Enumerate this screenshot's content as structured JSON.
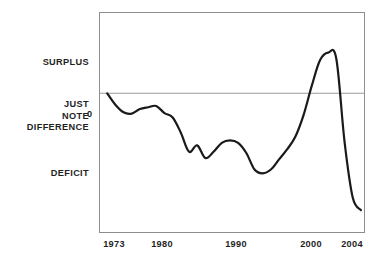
{
  "chart_data": {
    "type": "line",
    "title": "",
    "subtitle": "",
    "xlabel": "",
    "ylabel": "",
    "xlim": [
      1972,
      2004.5
    ],
    "ylim": [
      -5.5,
      3.2
    ],
    "grid": false,
    "legend_position": "none",
    "zero_line": 0,
    "x_tick_labels": [
      "1973",
      "1980",
      "1990",
      "2000",
      "2004"
    ],
    "x_tick_values": [
      1973,
      1980,
      1990,
      2000,
      2004
    ],
    "y_tick_labels": [
      "0"
    ],
    "y_tick_values": [
      0
    ],
    "y_category_labels": [
      {
        "label": "SURPLUS",
        "value": 1.9
      },
      {
        "label": "JUST NOTE DIFFERENCE",
        "value": 0.0
      },
      {
        "label": "DEFICIT",
        "value": -2.6
      }
    ],
    "series": [
      {
        "name": "Federal budget surplus/deficit (% of GDP)",
        "color": "#1a1a1a",
        "x": [
          1973,
          1974,
          1975,
          1976,
          1977,
          1978,
          1979,
          1980,
          1981,
          1982,
          1983,
          1984,
          1985,
          1986,
          1987,
          1988,
          1989,
          1990,
          1991,
          1992,
          1993,
          1994,
          1995,
          1996,
          1997,
          1998,
          1999,
          2000,
          2001,
          2002,
          2003,
          2004
        ],
        "values": [
          0.0,
          -0.45,
          -0.75,
          -0.8,
          -0.62,
          -0.55,
          -0.5,
          -0.78,
          -0.95,
          -1.55,
          -2.3,
          -2.05,
          -2.55,
          -2.3,
          -1.95,
          -1.85,
          -1.95,
          -2.35,
          -3.0,
          -3.15,
          -3.0,
          -2.6,
          -2.2,
          -1.7,
          -0.85,
          0.3,
          1.3,
          1.6,
          1.35,
          -1.9,
          -4.1,
          -4.6
        ]
      }
    ],
    "annotations": []
  },
  "labels": {
    "surplus": "SURPLUS",
    "just": "JUST",
    "note": "NOTE",
    "difference": "DIFFERENCE",
    "deficit": "DEFICIT",
    "zero": "0"
  },
  "xticks": {
    "t0": "1973",
    "t1": "1980",
    "t2": "1990",
    "t3": "2000",
    "t4": "2004"
  },
  "colors": {
    "line": "#1a1a1a",
    "zero_line": "#9a9a9a",
    "frame": "#8d8d8d",
    "text": "#1f1f1f",
    "background": "#ffffff"
  }
}
